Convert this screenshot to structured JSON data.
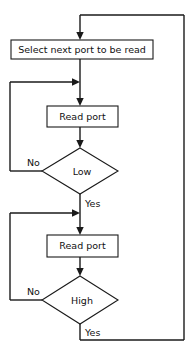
{
  "diagram": {
    "type": "flowchart",
    "title": "",
    "canvas": {
      "width": 195,
      "height": 349,
      "background": "#ffffff"
    },
    "stroke_color": "#1a1a1a",
    "text_color": "#111111",
    "nodes": [
      {
        "id": "select-port",
        "shape": "process",
        "label": "Select next port to be read",
        "x": 11,
        "y": 40,
        "width": 142,
        "height": 19
      },
      {
        "id": "read-port-1",
        "shape": "process",
        "label": "Read port",
        "x": 47,
        "y": 106,
        "width": 71,
        "height": 21
      },
      {
        "id": "decision-low",
        "shape": "decision",
        "label": "Low",
        "cx": 80,
        "cy": 171,
        "half_width": 38,
        "half_height": 23
      },
      {
        "id": "read-port-2",
        "shape": "process",
        "label": "Read port",
        "x": 47,
        "y": 235,
        "width": 71,
        "height": 22
      },
      {
        "id": "decision-high",
        "shape": "decision",
        "label": "High",
        "cx": 80,
        "cy": 300,
        "half_width": 38,
        "half_height": 24
      }
    ],
    "edge_labels": [
      {
        "id": "low-no",
        "text": "No",
        "x": 27,
        "y": 163,
        "anchor": "start"
      },
      {
        "id": "low-yes",
        "text": "Yes",
        "x": 85,
        "y": 204,
        "anchor": "start"
      },
      {
        "id": "high-no",
        "text": "No",
        "x": 27,
        "y": 292,
        "anchor": "start"
      },
      {
        "id": "high-yes",
        "text": "Yes",
        "x": 85,
        "y": 333,
        "anchor": "start"
      }
    ],
    "edges": [
      {
        "id": "loop-top-return",
        "from": "decision-high",
        "to": "select-port",
        "label": "Yes"
      },
      {
        "id": "select-to-read1",
        "from": "select-port",
        "to": "read-port-1",
        "label": ""
      },
      {
        "id": "read1-to-low",
        "from": "read-port-1",
        "to": "decision-low",
        "label": ""
      },
      {
        "id": "low-no-loop",
        "from": "decision-low",
        "to": "read-port-1",
        "label": "No"
      },
      {
        "id": "low-yes-to-read2",
        "from": "decision-low",
        "to": "read-port-2",
        "label": "Yes"
      },
      {
        "id": "read2-to-high",
        "from": "read-port-2",
        "to": "decision-high",
        "label": ""
      },
      {
        "id": "high-no-loop",
        "from": "decision-high",
        "to": "read-port-2",
        "label": "No"
      }
    ]
  }
}
